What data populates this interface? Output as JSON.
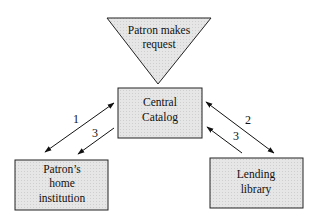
{
  "diagram": {
    "type": "interlibrary-loan-flow",
    "nodes": {
      "request": {
        "line1": "Patron makes",
        "line2": "request",
        "shape": "inverted-triangle"
      },
      "catalog": {
        "line1": "Central",
        "line2": "Catalog",
        "shape": "box"
      },
      "home": {
        "line1": "Patron’s",
        "line2": "home",
        "line3": "institution",
        "shape": "box"
      },
      "lending": {
        "line1": "Lending",
        "line2": "library",
        "shape": "box"
      }
    },
    "edges": [
      {
        "from": "catalog",
        "to": "home",
        "label": "1",
        "direction": "bidirectional"
      },
      {
        "from": "catalog",
        "to": "home",
        "label": "3",
        "direction": "to-home"
      },
      {
        "from": "catalog",
        "to": "lending",
        "label": "2",
        "direction": "bidirectional"
      },
      {
        "from": "lending",
        "to": "catalog",
        "label": "3",
        "direction": "to-catalog"
      }
    ],
    "colors": {
      "fill": "#e4e4e4",
      "stroke": "#222222"
    }
  }
}
